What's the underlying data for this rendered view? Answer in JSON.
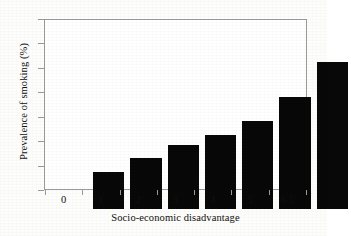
{
  "chart_data": {
    "type": "bar",
    "title": "",
    "xlabel": "Socio-economic disadvantage",
    "ylabel": "Prevalence of smoking (%)",
    "categories": [
      "0",
      "1",
      "2",
      "3",
      "4",
      "5",
      "6.5"
    ],
    "values": [
      15.5,
      21.3,
      26.6,
      30.7,
      36.5,
      46.3,
      61.0
    ],
    "ylim": [
      0,
      70
    ],
    "yticks": [
      "0",
      "10",
      "20",
      "30",
      "40",
      "50",
      "60",
      "70"
    ],
    "ytick_values": [
      0,
      10,
      20,
      30,
      40,
      50,
      60,
      70
    ],
    "grid": false,
    "legend": "none",
    "bar_color": "#080808",
    "frame_color": "#9a9a9a",
    "background_color": "#ffffff"
  }
}
